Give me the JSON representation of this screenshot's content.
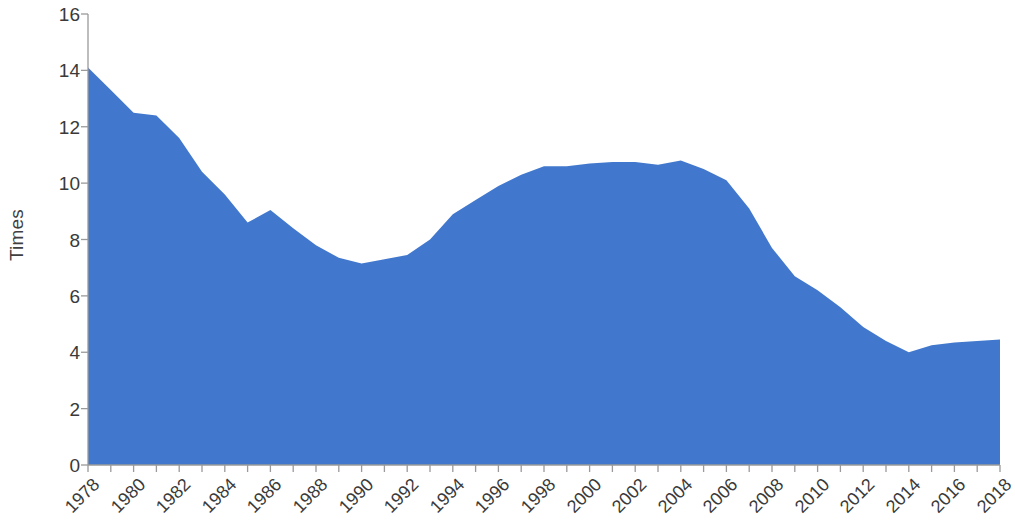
{
  "chart_data": {
    "type": "area",
    "title": "",
    "subtitle": "",
    "xlabel": "",
    "ylabel": "Times",
    "xlim": [
      1978,
      2018
    ],
    "ylim": [
      0,
      16
    ],
    "grid": false,
    "legend": null,
    "series_color": "#4178CE",
    "y_ticks": [
      0,
      2,
      4,
      6,
      8,
      10,
      12,
      14,
      16
    ],
    "x_ticks": [
      1978,
      1980,
      1982,
      1984,
      1986,
      1988,
      1990,
      1992,
      1994,
      1996,
      1998,
      2000,
      2002,
      2004,
      2006,
      2008,
      2010,
      2012,
      2014,
      2016,
      2018
    ],
    "x_tick_labels": [
      "1978",
      "1980",
      "1982",
      "1984",
      "1986",
      "1988",
      "1990",
      "1992",
      "1994",
      "1996",
      "1998",
      "2000",
      "2002",
      "2004",
      "2006",
      "2008",
      "2010",
      "2012",
      "2014",
      "2016",
      "2018"
    ],
    "y_tick_labels": [
      "0",
      "2",
      "4",
      "6",
      "8",
      "10",
      "12",
      "14",
      "16"
    ],
    "x": [
      1978,
      1979,
      1980,
      1981,
      1982,
      1983,
      1984,
      1985,
      1986,
      1987,
      1988,
      1989,
      1990,
      1991,
      1992,
      1993,
      1994,
      1995,
      1996,
      1997,
      1998,
      1999,
      2000,
      2001,
      2002,
      2003,
      2004,
      2005,
      2006,
      2007,
      2008,
      2009,
      2010,
      2011,
      2012,
      2013,
      2014,
      2015,
      2016,
      2017,
      2018
    ],
    "values": [
      14.1,
      13.3,
      12.5,
      12.4,
      11.6,
      10.4,
      9.6,
      8.6,
      9.05,
      8.4,
      7.8,
      7.35,
      7.15,
      7.3,
      7.45,
      8.0,
      8.9,
      9.4,
      9.9,
      10.3,
      10.6,
      10.6,
      10.7,
      10.75,
      10.75,
      10.65,
      10.8,
      10.5,
      10.1,
      9.1,
      7.7,
      6.7,
      6.2,
      5.6,
      4.9,
      4.4,
      4.0,
      4.25,
      4.35,
      4.4,
      4.45
    ]
  }
}
